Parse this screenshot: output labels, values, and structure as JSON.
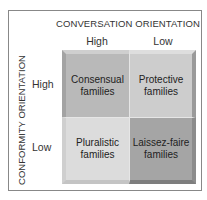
{
  "diagram": {
    "x_axis_title": "CONVERSATION ORIENTATION",
    "y_axis_title": "CONFORMITY ORIENTATION",
    "columns": [
      "High",
      "Low"
    ],
    "rows": [
      "High",
      "Low"
    ],
    "cells": {
      "high_high": "Consensual families",
      "high_low": "Protective families",
      "low_high": "Pluralistic families",
      "low_low": "Laissez-faire families"
    },
    "colors": {
      "consensual": "#b9b9b9",
      "protective": "#cdcdcd",
      "pluralistic": "#dcdcdc",
      "laissez_faire": "#a5a5a5"
    }
  }
}
